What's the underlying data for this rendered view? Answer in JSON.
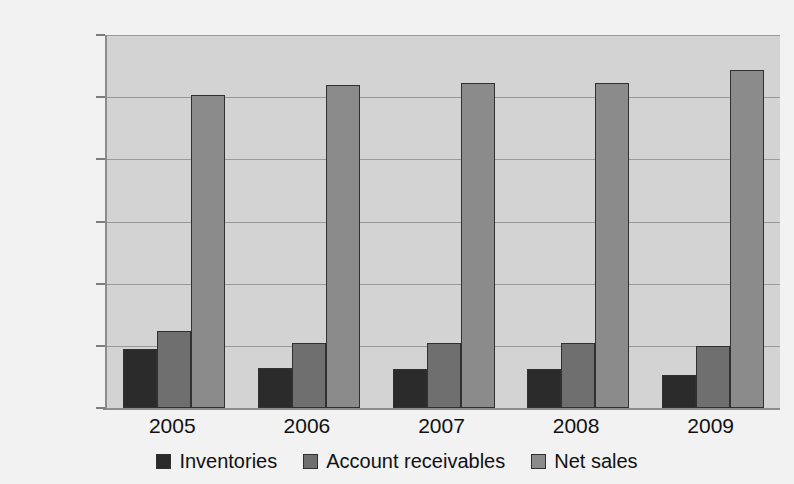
{
  "chart_data": {
    "type": "bar",
    "title": "",
    "xlabel": "",
    "ylabel": "",
    "categories": [
      "2005",
      "2006",
      "2007",
      "2008",
      "2009"
    ],
    "series": [
      {
        "name": "Inventories",
        "color": "#2b2b2b",
        "values": [
          19000,
          12900,
          12700,
          12600,
          10500
        ]
      },
      {
        "name": "Account receivables",
        "color": "#6f6f6f",
        "values": [
          24700,
          20900,
          20900,
          20800,
          20100
        ]
      },
      {
        "name": "Net sales",
        "color": "#8b8b8b",
        "values": [
          100800,
          103800,
          104400,
          104400,
          108800
        ]
      }
    ],
    "ylim": [
      0,
      120000
    ],
    "ytick_values": [
      0,
      20000,
      40000,
      60000,
      80000,
      100000,
      120000
    ],
    "ytick_labels": [
      "0",
      "20,000",
      "40,000",
      "60,000",
      "80,000",
      "100,000",
      "120,000"
    ],
    "grid": true,
    "legend_position": "bottom",
    "plot_background": "#d3d3d3",
    "figure_background": "#f2f2f2"
  },
  "legend": {
    "items": [
      {
        "label": "Inventories",
        "color": "#2b2b2b"
      },
      {
        "label": "Account receivables",
        "color": "#6f6f6f"
      },
      {
        "label": "Net sales",
        "color": "#8b8b8b"
      }
    ]
  }
}
